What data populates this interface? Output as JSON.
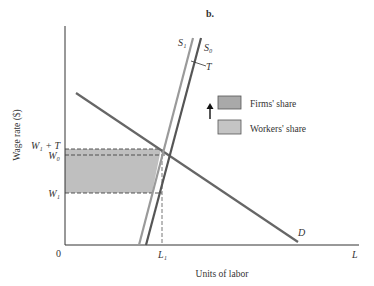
{
  "panel_label": "b.",
  "axes": {
    "ylabel": "Wage rate ($)",
    "xlabel": "Units of labor",
    "origin_label": "0",
    "x_end_label": "L"
  },
  "ticks": {
    "y": [
      {
        "label": "W₁ + T",
        "key": "W1_plus_T"
      },
      {
        "label": "W₀",
        "key": "W0"
      },
      {
        "label": "W₁",
        "key": "W1"
      }
    ],
    "x": [
      {
        "label": "L₁",
        "key": "L1"
      }
    ]
  },
  "curves": {
    "S1": {
      "label": "S₁",
      "color": "#9a9a9a"
    },
    "S0": {
      "label": "S₀",
      "color": "#555555"
    },
    "D": {
      "label": "D",
      "color": "#666666"
    },
    "tax_marker": {
      "label": "T"
    }
  },
  "legend": {
    "items": [
      {
        "label": "Firms' share",
        "color": "#a9a9a9"
      },
      {
        "label": "Workers' share",
        "color": "#c4c4c4"
      }
    ],
    "arrow": "up-arrow"
  },
  "colors": {
    "shaded_area": "#b8b8b8",
    "axis": "#333333"
  }
}
